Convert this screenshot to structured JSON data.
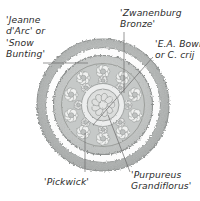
{
  "illustration": {
    "title": "Circular crocus planting plan",
    "style": "grayscale botanical pen-and-wash drawing",
    "background_color": "#ffffff",
    "ink_color": "#2c2c2c",
    "center": {
      "x": 103,
      "y": 105
    },
    "outer_radius": 67,
    "rings": [
      {
        "name": "outer-fringe-ring",
        "outer_r": 67,
        "inner_r": 58,
        "fill": "#b9bcbb"
      },
      {
        "name": "pale-gap-ring",
        "outer_r": 58,
        "inner_r": 50,
        "fill": "#fbfbfb"
      },
      {
        "name": "second-fringe-ring",
        "outer_r": 50,
        "inner_r": 42,
        "fill": "#b2b5b4"
      },
      {
        "name": "mid-wash-ring",
        "outer_r": 42,
        "inner_r": 20,
        "fill": "#c8cac9"
      },
      {
        "name": "center-rosette",
        "outer_r": 20,
        "inner_r": 0,
        "fill": "#e9eae9"
      }
    ]
  },
  "labels": [
    {
      "id": "jeanne-darc",
      "name": "label-jeanne-darc",
      "lines": [
        "'Jeanne",
        "d'Arc' or",
        "'Snow",
        "Bunting'"
      ],
      "text": "'Jeanne d'Arc' or 'Snow Bunting'",
      "position": "top-left",
      "leader": {
        "from_x": 43,
        "from_y": 63,
        "to_x": 88,
        "to_y": 63
      }
    },
    {
      "id": "zwanenburg-bronze",
      "name": "label-zwanenburg-bronze",
      "lines": [
        "'Zwanenburg",
        "Bronze'"
      ],
      "text": "'Zwanenburg Bronze'",
      "position": "top-center",
      "leader": {
        "from_x": 124,
        "from_y": 32,
        "to_x": 124,
        "to_y": 93
      }
    },
    {
      "id": "ea-bowles",
      "name": "label-ea-bowles",
      "lines": [
        "'E.A. Bowle",
        "or C. crij"
      ],
      "text": "'E.A. Bowles' or C. crijensis",
      "clipped": true,
      "position": "top-right",
      "leader": {
        "from_x": 153,
        "from_y": 57,
        "to_x": 93,
        "to_y": 125
      }
    },
    {
      "id": "pickwick",
      "name": "label-pickwick",
      "lines": [
        "'Pickwick'"
      ],
      "text": "'Pickwick'",
      "position": "bottom-left",
      "leader": {
        "from_x": 85,
        "from_y": 172,
        "to_x": 85,
        "to_y": 133
      }
    },
    {
      "id": "purpureus-grandiflorus",
      "name": "label-purpureus-grandiflorus",
      "lines": [
        "'Purpureus",
        "Grandiflorus'"
      ],
      "text": "'Purpureus Grandiflorus'",
      "position": "bottom-right",
      "leader": {
        "from_x": 130,
        "from_y": 172,
        "to_x": 108,
        "to_y": 115
      }
    }
  ]
}
